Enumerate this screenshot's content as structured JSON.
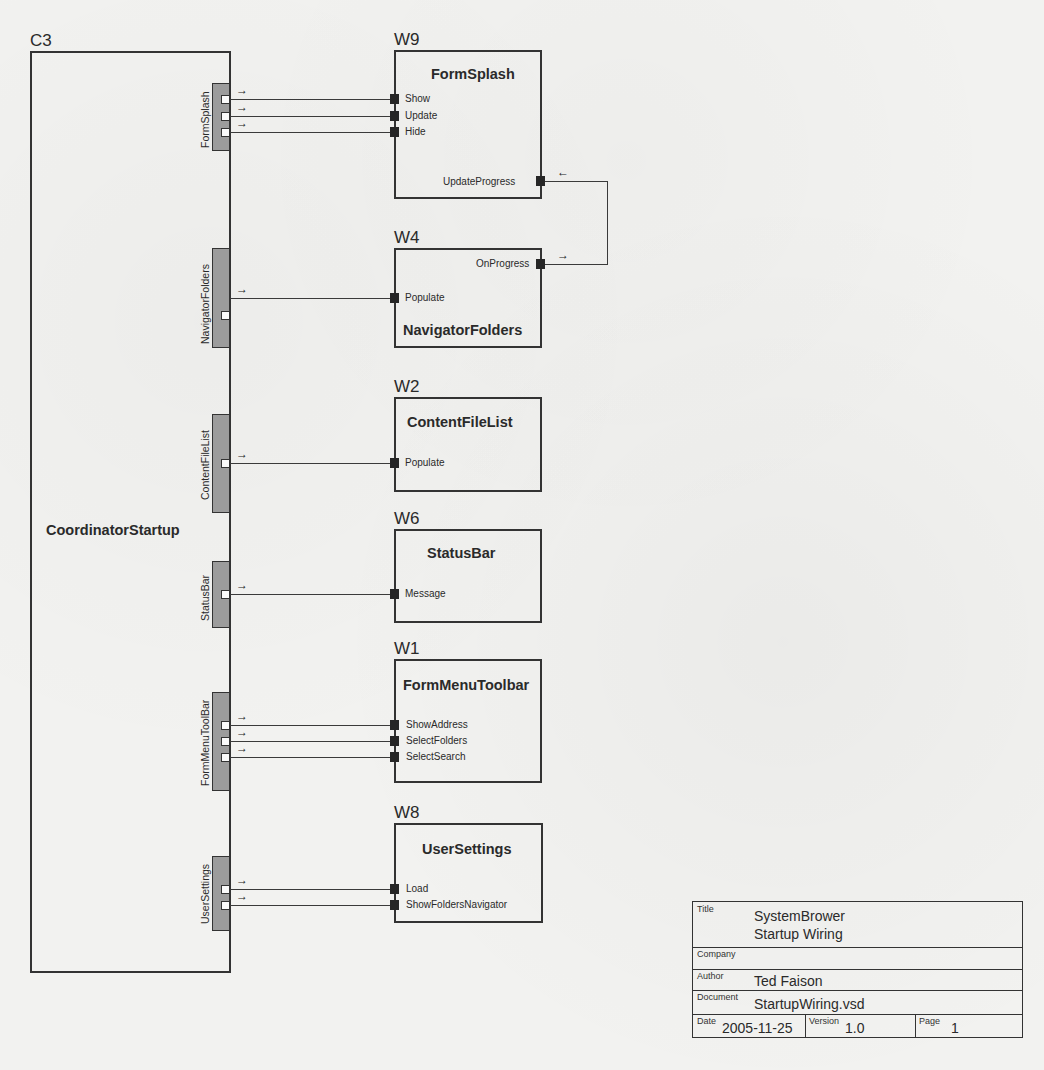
{
  "coordinator": {
    "id": "C3",
    "name": "CoordinatorStartup",
    "ports": [
      {
        "label": "FormSplash",
        "outputs": 3
      },
      {
        "label": "NavigatorFolders",
        "outputs": 1
      },
      {
        "label": "ContentFileList",
        "outputs": 1
      },
      {
        "label": "StatusBar",
        "outputs": 1
      },
      {
        "label": "FormMenuToolBar",
        "outputs": 3
      },
      {
        "label": "UserSettings",
        "outputs": 2
      }
    ]
  },
  "components": [
    {
      "id": "W9",
      "name": "FormSplash",
      "inputs": [
        "Show",
        "Update",
        "Hide"
      ],
      "outputs": [
        "UpdateProgress"
      ]
    },
    {
      "id": "W4",
      "name": "NavigatorFolders",
      "inputs": [
        "Populate"
      ],
      "outputs": [
        "OnProgress"
      ]
    },
    {
      "id": "W2",
      "name": "ContentFileList",
      "inputs": [
        "Populate"
      ]
    },
    {
      "id": "W6",
      "name": "StatusBar",
      "inputs": [
        "Message"
      ]
    },
    {
      "id": "W1",
      "name": "FormMenuToolbar",
      "inputs": [
        "ShowAddress",
        "SelectFolders",
        "SelectSearch"
      ]
    },
    {
      "id": "W8",
      "name": "UserSettings",
      "inputs": [
        "Load",
        "ShowFoldersNavigator"
      ]
    }
  ],
  "connections": [
    {
      "from": "C3.FormSplash.1",
      "to": "W9.Show"
    },
    {
      "from": "C3.FormSplash.2",
      "to": "W9.Update"
    },
    {
      "from": "C3.FormSplash.3",
      "to": "W9.Hide"
    },
    {
      "from": "C3.NavigatorFolders",
      "to": "W4.Populate"
    },
    {
      "from": "C3.ContentFileList",
      "to": "W2.Populate"
    },
    {
      "from": "C3.StatusBar",
      "to": "W6.Message"
    },
    {
      "from": "C3.FormMenuToolBar.1",
      "to": "W1.ShowAddress"
    },
    {
      "from": "C3.FormMenuToolBar.2",
      "to": "W1.SelectFolders"
    },
    {
      "from": "C3.FormMenuToolBar.3",
      "to": "W1.SelectSearch"
    },
    {
      "from": "C3.UserSettings.1",
      "to": "W8.Load"
    },
    {
      "from": "C3.UserSettings.2",
      "to": "W8.ShowFoldersNavigator"
    },
    {
      "from": "W4.OnProgress",
      "to": "W9.UpdateProgress"
    }
  ],
  "arrow_glyph": "→",
  "arrow_back_glyph": "←",
  "title_block": {
    "title_caption": "Title",
    "title_line1": "SystemBrower",
    "title_line2": "Startup Wiring",
    "company_caption": "Company",
    "company": "",
    "author_caption": "Author",
    "author": "Ted Faison",
    "document_caption": "Document",
    "document": "StartupWiring.vsd",
    "date_caption": "Date",
    "date": "2005-11-25",
    "version_caption": "Version",
    "version": "1.0",
    "page_caption": "Page",
    "page": "1"
  },
  "colors": {
    "paper": "#f2f2f0",
    "line": "#333333",
    "port_strip": "#9c9c9c",
    "input_port": "#262626"
  }
}
